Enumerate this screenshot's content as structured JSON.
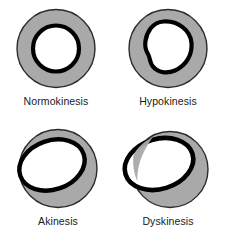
{
  "figure": {
    "background_color": "#ffffff",
    "myocardium_fill": "#a9a9a9",
    "myocardium_stroke": "#1a1a1a",
    "endocardium_stroke": "#000000",
    "cavity_fill": "#ffffff",
    "label_color": "#1a1a1a"
  },
  "panels": [
    {
      "id": "normokinesis",
      "label": "Normokinesis",
      "description": "Concentric thick ring: circular epicardium with a smaller concentric circular endocardial border; uniform wall thickness all around.",
      "outer_shape": "circle",
      "inner_shape": "circle",
      "inner_offset": "centered",
      "inner_exceeds_outer": false
    },
    {
      "id": "hypokinesis",
      "label": "Hypokinesis",
      "description": "Circular epicardium with an enlarged, slightly irregular rounded endocardial border shifted up and to the left; wall thinner on the upper-left.",
      "outer_shape": "circle",
      "inner_shape": "rounded-irregular",
      "inner_offset": "up-left",
      "inner_exceeds_outer": false
    },
    {
      "id": "akinesis",
      "label": "Akinesis",
      "description": "Circular epicardium with a large tilted elliptical endocardial border touching the upper-left epicardial edge; no wall thickening on that side.",
      "outer_shape": "circle",
      "inner_shape": "tilted-ellipse",
      "inner_offset": "up-left, touching edge",
      "inner_exceeds_outer": false
    },
    {
      "id": "dyskinesis",
      "label": "Dyskinesis",
      "description": "Circular epicardium with a large tilted elliptical endocardial border bulging outward beyond the epicardial outline at the upper-left; outward paradoxical motion.",
      "outer_shape": "circle",
      "inner_shape": "tilted-ellipse",
      "inner_offset": "up-left, protruding",
      "inner_exceeds_outer": true
    }
  ]
}
